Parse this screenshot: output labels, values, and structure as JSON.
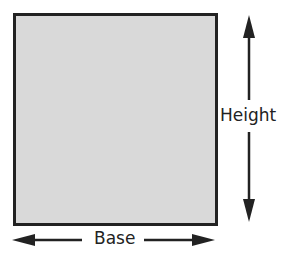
{
  "diagram": {
    "shape": "rectangle",
    "fill_color": "#d9d9d9",
    "stroke_color": "#222222",
    "labels": {
      "height": "Height",
      "base": "Base"
    },
    "arrows": [
      {
        "name": "height-arrow",
        "orientation": "vertical",
        "double_headed": true
      },
      {
        "name": "base-arrow",
        "orientation": "horizontal",
        "double_headed": true
      }
    ]
  }
}
